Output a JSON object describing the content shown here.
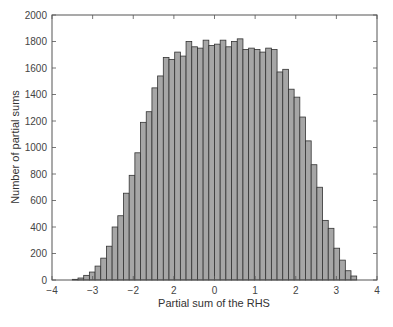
{
  "chart_data": {
    "type": "bar",
    "subtype": "histogram",
    "title": "",
    "xlabel": "Partial sum of the RHS",
    "ylabel": "Number of partial sums",
    "xlim": [
      -4,
      4
    ],
    "ylim": [
      0,
      2000
    ],
    "x_ticks": [
      -4,
      -3,
      -2,
      -1,
      0,
      1,
      2,
      3,
      4
    ],
    "x_tick_labels": [
      "−4",
      "−3",
      "−2",
      "2",
      "0",
      "1",
      "2",
      "3",
      "4"
    ],
    "y_ticks": [
      0,
      200,
      400,
      600,
      800,
      1000,
      1200,
      1400,
      1600,
      1800,
      2000
    ],
    "y_tick_labels": [
      "0",
      "200",
      "400",
      "600",
      "800",
      "1000",
      "1200",
      "1400",
      "1600",
      "1800",
      "2000"
    ],
    "grid": false,
    "legend": null,
    "bin_start": -3.5,
    "bin_width": 0.14,
    "values": [
      5,
      15,
      35,
      60,
      105,
      165,
      255,
      400,
      485,
      655,
      790,
      960,
      1190,
      1270,
      1450,
      1540,
      1680,
      1665,
      1720,
      1690,
      1800,
      1760,
      1750,
      1810,
      1770,
      1780,
      1810,
      1760,
      1800,
      1820,
      1740,
      1750,
      1740,
      1720,
      1750,
      1740,
      1570,
      1590,
      1440,
      1380,
      1230,
      1050,
      870,
      700,
      450,
      390,
      240,
      150,
      70,
      30
    ],
    "colors": {
      "bar_fill": "#a6a6a6",
      "bar_edge": "#333333",
      "axes": "#555555"
    }
  },
  "axes": {
    "xlabel": "Partial sum of the RHS",
    "ylabel": "Number of partial sums"
  }
}
